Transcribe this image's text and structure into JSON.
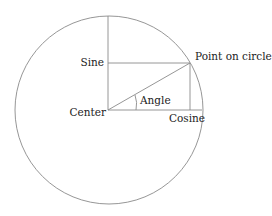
{
  "diagram": {
    "type": "unit-circle",
    "labels": {
      "sine": "Sine",
      "cosine": "Cosine",
      "center": "Center",
      "angle": "Angle",
      "point": "Point on circle"
    },
    "colors": {
      "line": "#8a8a8a",
      "text": "#222222",
      "background": "#ffffff"
    }
  }
}
